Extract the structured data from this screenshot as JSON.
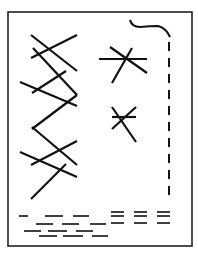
{
  "figure": {
    "type": "line-drawing",
    "colors": {
      "background": "#ffffff",
      "stroke": "#111111",
      "frame": "#222222"
    },
    "frame": {
      "x": 8,
      "y": 12,
      "width": 184,
      "height": 234,
      "stroke_width": 1.6
    },
    "stroke_width": 2.2,
    "left_cross_lines": [
      {
        "x1": 31,
        "y1": 35,
        "x2": 77,
        "y2": 71
      },
      {
        "x1": 31,
        "y1": 58,
        "x2": 77,
        "y2": 35
      },
      {
        "x1": 33,
        "y1": 48,
        "x2": 77,
        "y2": 95
      },
      {
        "x1": 20,
        "y1": 82,
        "x2": 77,
        "y2": 106
      },
      {
        "x1": 32,
        "y1": 93,
        "x2": 66,
        "y2": 71
      },
      {
        "x1": 77,
        "y1": 95,
        "x2": 32,
        "y2": 129
      },
      {
        "x1": 32,
        "y1": 127,
        "x2": 77,
        "y2": 165
      },
      {
        "x1": 31,
        "y1": 165,
        "x2": 77,
        "y2": 141
      },
      {
        "x1": 20,
        "y1": 152,
        "x2": 77,
        "y2": 177
      },
      {
        "x1": 31,
        "y1": 199,
        "x2": 66,
        "y2": 164
      }
    ],
    "stars": [
      {
        "name": "upper-star",
        "lines": [
          {
            "x1": 99,
            "y1": 59,
            "x2": 147,
            "y2": 59
          },
          {
            "x1": 110,
            "y1": 47,
            "x2": 147,
            "y2": 73
          },
          {
            "x1": 112,
            "y1": 83,
            "x2": 132,
            "y2": 48
          }
        ]
      },
      {
        "name": "lower-star",
        "lines": [
          {
            "x1": 112,
            "y1": 117,
            "x2": 136,
            "y2": 117
          },
          {
            "x1": 112,
            "y1": 107,
            "x2": 136,
            "y2": 142
          },
          {
            "x1": 112,
            "y1": 129,
            "x2": 136,
            "y2": 107
          }
        ]
      }
    ],
    "hook_curve": "M130 20 Q132 27 140 27 Q150 26 158 26 Q166 28 170 37",
    "dashed_vertical": {
      "x": 169,
      "y1": 42,
      "y2": 202,
      "dash": 9,
      "gap": 7
    },
    "bottom_dash_rows": [
      {
        "y": 216,
        "segments": [
          [
            19,
            28
          ],
          [
            45,
            63
          ],
          [
            73,
            89
          ]
        ]
      },
      {
        "y": 224,
        "segments": [
          [
            36,
            53
          ],
          [
            62,
            79
          ],
          [
            90,
            106
          ]
        ]
      },
      {
        "y": 231,
        "segments": [
          [
            24,
            41
          ],
          [
            48,
            67
          ],
          [
            76,
            93
          ]
        ]
      },
      {
        "y": 236,
        "segments": [
          [
            39,
            57
          ],
          [
            63,
            83
          ],
          [
            92,
            108
          ]
        ]
      }
    ],
    "right_triple_dashes": {
      "ys": [
        212,
        216,
        223
      ],
      "columns": [
        [
          111,
          124
        ],
        [
          134,
          147
        ],
        [
          157,
          170
        ]
      ]
    }
  }
}
